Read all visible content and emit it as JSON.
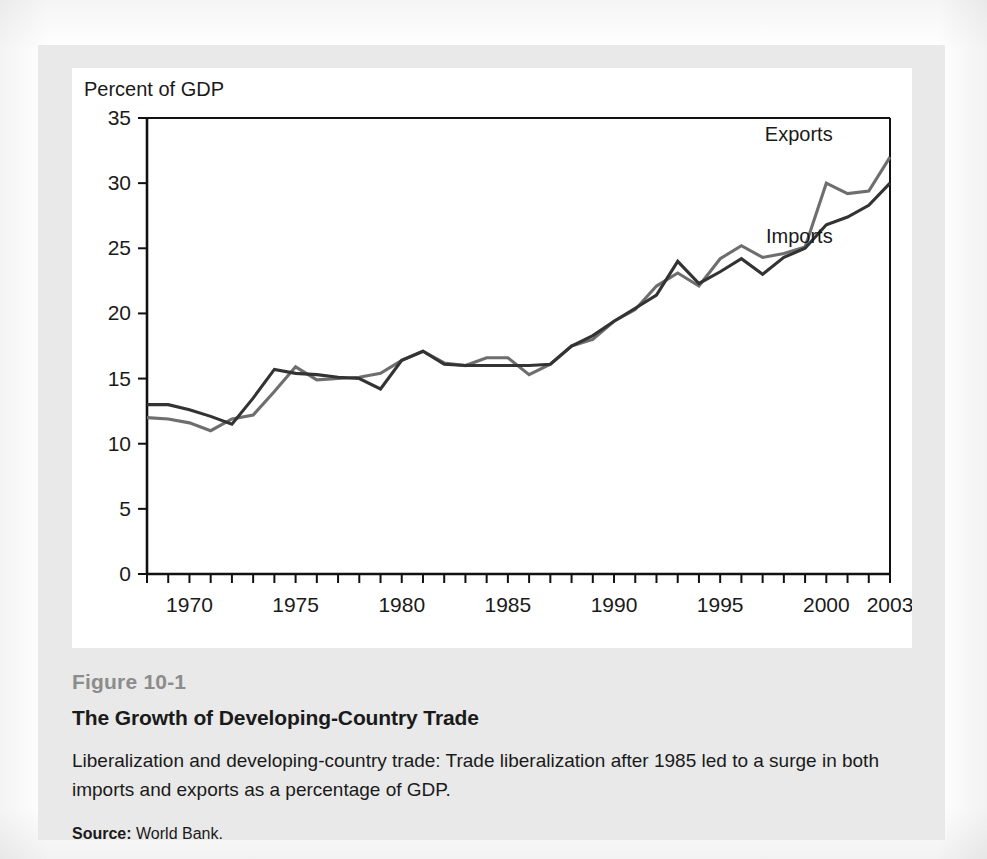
{
  "figure": {
    "number": "Figure 10-1",
    "title": "The Growth of Developing-Country Trade",
    "description": "Liberalization and developing-country trade: Trade liberalization after 1985 led to a surge in both imports and exports as a percentage of GDP.",
    "source_label": "Source:",
    "source_text": "World Bank."
  },
  "chart_data": {
    "type": "line",
    "title": "The Growth of Developing-Country Trade",
    "xlabel": "",
    "ylabel": "Percent of GDP",
    "ylim": [
      0,
      35
    ],
    "xlim": [
      1968,
      2003
    ],
    "yticks": [
      0,
      5,
      10,
      15,
      20,
      25,
      30,
      35
    ],
    "ytick_labels": [
      "0",
      "5",
      "10",
      "15",
      "20",
      "25",
      "30",
      "35"
    ],
    "xticks": [
      1970,
      1975,
      1980,
      1985,
      1990,
      1995,
      2000,
      2003
    ],
    "xtick_labels": [
      "1970",
      "1975",
      "1980",
      "1985",
      "1990",
      "1995",
      "2000",
      "2003"
    ],
    "minor_xticks_every": 1,
    "grid": false,
    "legend_position": "inline-right",
    "x": [
      1968,
      1969,
      1970,
      1971,
      1972,
      1973,
      1974,
      1975,
      1976,
      1977,
      1978,
      1979,
      1980,
      1981,
      1982,
      1983,
      1984,
      1985,
      1986,
      1987,
      1988,
      1989,
      1990,
      1991,
      1992,
      1993,
      1994,
      1995,
      1996,
      1997,
      1998,
      1999,
      2000,
      2001,
      2002,
      2003
    ],
    "series": [
      {
        "name": "Exports",
        "color": "#6e6e6e",
        "values": [
          12.0,
          11.9,
          11.6,
          11.0,
          11.9,
          12.2,
          14.0,
          15.9,
          14.9,
          15.0,
          15.1,
          15.4,
          16.4,
          17.1,
          16.2,
          16.0,
          16.6,
          16.6,
          15.3,
          16.1,
          17.5,
          18.0,
          19.4,
          20.3,
          22.1,
          23.1,
          22.1,
          24.2,
          25.2,
          24.3,
          24.6,
          25.1,
          30.0,
          29.2,
          29.4,
          32.0
        ]
      },
      {
        "name": "Imports",
        "color": "#333333",
        "values": [
          13.0,
          13.0,
          12.6,
          12.1,
          11.5,
          13.5,
          15.7,
          15.4,
          15.3,
          15.1,
          15.0,
          14.2,
          16.4,
          17.1,
          16.1,
          16.0,
          16.0,
          16.0,
          16.0,
          16.1,
          17.5,
          18.3,
          19.4,
          20.4,
          21.4,
          24.0,
          22.3,
          23.2,
          24.2,
          23.0,
          24.3,
          25.0,
          26.8,
          27.4,
          28.3,
          30.0
        ]
      }
    ],
    "annotations": [
      {
        "text": "Exports",
        "x": 2000.3,
        "y": 33.2
      },
      {
        "text": "Imports",
        "x": 2000.3,
        "y": 25.4
      }
    ]
  }
}
